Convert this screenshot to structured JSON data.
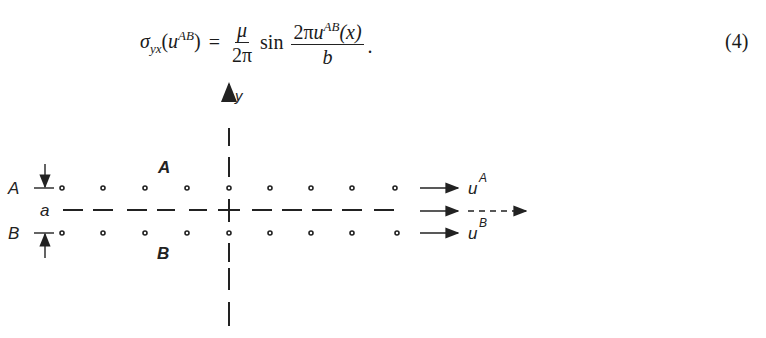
{
  "equation": {
    "lhs_symbol": "σ",
    "lhs_sub": "yx",
    "lhs_arg_var": "u",
    "lhs_arg_sup": "AB",
    "equals": "=",
    "frac1_num": "μ",
    "frac1_den": "2π",
    "func": "sin",
    "frac2_num_coef": "2π",
    "frac2_num_var": "u",
    "frac2_num_sup": "AB",
    "frac2_num_arg": "(x)",
    "frac2_den": "b",
    "trailing": ".",
    "number": "(4)"
  },
  "figure": {
    "axis_label_y": "y",
    "row_label_top": "A",
    "row_label_bottom": "B",
    "spacing_label": "a",
    "region_label_top": "A",
    "region_label_bottom": "B",
    "displacement_top_var": "u",
    "displacement_top_sup": "A",
    "displacement_bottom_var": "u",
    "displacement_bottom_sup": "B",
    "atom_columns_x": [
      62,
      103,
      145,
      187,
      229,
      270,
      311,
      352,
      395
    ],
    "row_top_y": 188,
    "row_bottom_y": 233,
    "center_line_y": 210,
    "axis_x": 229,
    "stroke_color": "#222222"
  }
}
